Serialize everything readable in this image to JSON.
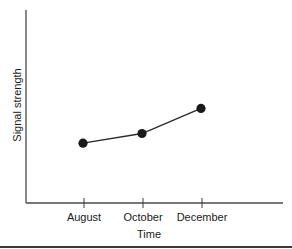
{
  "chart_data": {
    "type": "line",
    "title": "",
    "xlabel": "Time",
    "ylabel": "Signal strength",
    "categories": [
      "August",
      "October",
      "December"
    ],
    "series": [
      {
        "name": "Signal strength",
        "values": [
          0.31,
          0.36,
          0.49
        ]
      }
    ],
    "ylim": [
      0,
      1
    ],
    "y_ticks_labeled": false,
    "grid": false,
    "legend": null,
    "markers": "filled-circle",
    "color": "#1a1a1a"
  },
  "labels": {
    "x_axis_title": "Time",
    "y_axis_title": "Signal strength",
    "x_ticks": [
      "August",
      "October",
      "December"
    ]
  }
}
